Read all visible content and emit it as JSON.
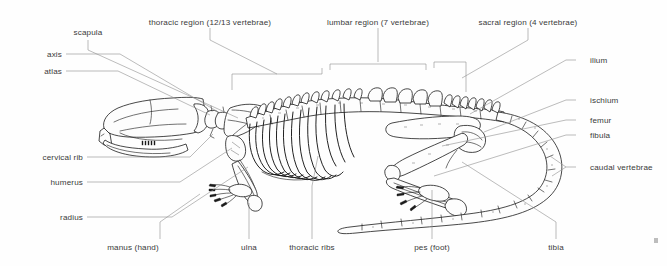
{
  "figure": {
    "background_color": "#fefefe",
    "bone_outline_color": "#1b1b1b",
    "leader_line_color": "#8e8e8e",
    "label_text_color": "#3a3a3a"
  },
  "labels": {
    "scapula": "scapula",
    "thoracic_region": "thoracic region  (12/13 vertebrae)",
    "lumbar_region": "lumbar region (7  vertebrae)",
    "sacral_region": "sacral region (4  vertebrae)",
    "axis": "axis",
    "atlas": "atlas",
    "cervical_rib": "cervical rib",
    "humerus": "humerus",
    "radius": "radius",
    "ilium": "ilium",
    "ischium": "ischium",
    "femur": "femur",
    "fibula": "fibula",
    "caudal_vertebrae": "caudal vertebrae",
    "manus": "manus (hand)",
    "ulna": "ulna",
    "thoracic_ribs": "thoracic ribs",
    "pes": "pes (foot)",
    "tibia": "tibia"
  }
}
